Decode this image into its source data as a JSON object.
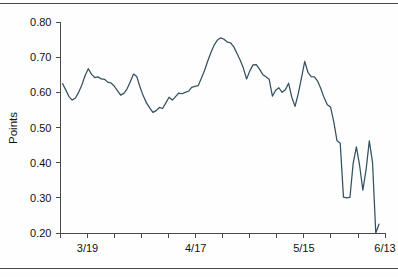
{
  "figure": {
    "rule_top": "horizontal-rule",
    "rule_bottom": "horizontal-rule"
  },
  "chart_data": {
    "type": "line",
    "title": "",
    "xlabel": "",
    "ylabel": "Points",
    "ylim": [
      0.2,
      0.8
    ],
    "yticks": [
      "0.20",
      "0.30",
      "0.40",
      "0.50",
      "0.60",
      "0.70",
      "0.80"
    ],
    "ytick_values": [
      0.2,
      0.3,
      0.4,
      0.5,
      0.6,
      0.7,
      0.8
    ],
    "xticks_labeled": [
      "3/19",
      "4/17",
      "5/15",
      "6/13"
    ],
    "xtick_count": 13,
    "grid": false,
    "legend": "none",
    "line_color": "#33515f",
    "axis_color": "#4a4a4a",
    "x": [
      0,
      1,
      2,
      3,
      4,
      5,
      6,
      7,
      8,
      9,
      10,
      11,
      12,
      13,
      14,
      15,
      16,
      17,
      18,
      19,
      20,
      21,
      22,
      23,
      24,
      25,
      26,
      27,
      28,
      29,
      30,
      31,
      32,
      33,
      34,
      35,
      36,
      37,
      38,
      39,
      40,
      41,
      42,
      43,
      44,
      45,
      46,
      47,
      48,
      49,
      50,
      51,
      52,
      53,
      54,
      55,
      56,
      57,
      58,
      59,
      60,
      61,
      62,
      63,
      64,
      65,
      66,
      67,
      68,
      69,
      70,
      71,
      72,
      73,
      74,
      75,
      76,
      77,
      78,
      79,
      80,
      81,
      82,
      83,
      84,
      85,
      86,
      87,
      88,
      89
    ],
    "values": [
      0.625,
      0.607,
      0.588,
      0.578,
      0.584,
      0.6,
      0.621,
      0.648,
      0.667,
      0.651,
      0.642,
      0.644,
      0.638,
      0.637,
      0.629,
      0.627,
      0.618,
      0.605,
      0.592,
      0.597,
      0.61,
      0.63,
      0.652,
      0.645,
      0.615,
      0.59,
      0.57,
      0.556,
      0.543,
      0.548,
      0.557,
      0.554,
      0.57,
      0.586,
      0.578,
      0.588,
      0.598,
      0.596,
      0.6,
      0.603,
      0.614,
      0.617,
      0.619,
      0.64,
      0.663,
      0.69,
      0.714,
      0.735,
      0.749,
      0.755,
      0.751,
      0.743,
      0.741,
      0.73,
      0.711,
      0.692,
      0.669,
      0.638,
      0.661,
      0.678,
      0.679,
      0.666,
      0.651,
      0.644,
      0.637,
      0.589,
      0.606,
      0.613,
      0.6,
      0.607,
      0.626,
      0.586,
      0.56,
      0.596,
      0.641,
      0.688,
      0.657,
      0.645,
      0.644,
      0.632,
      0.61,
      0.585,
      0.565,
      0.558,
      0.516,
      0.462,
      0.455,
      0.302,
      0.3,
      0.301
    ],
    "values_tail": [
      0.398,
      0.445,
      0.392,
      0.322,
      0.38,
      0.462,
      0.4,
      0.2,
      0.225
    ]
  },
  "annotations": {
    "y_axis_label": "Points"
  }
}
